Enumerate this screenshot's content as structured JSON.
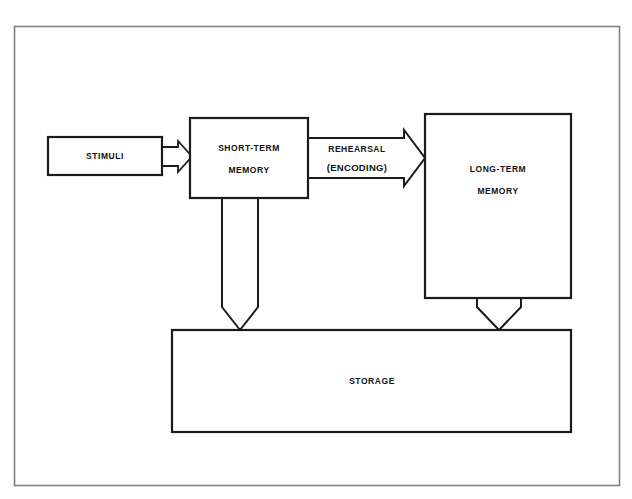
{
  "diagram": {
    "background_color": "#ffffff",
    "frame": {
      "name": "outer-border",
      "stroke_color": "#808080"
    },
    "nodes": [
      {
        "id": "stimuli",
        "label": "STIMULI",
        "shape": "rectangle"
      },
      {
        "id": "short-term-memory",
        "label_line1": "SHORT-TERM",
        "label_line2": "MEMORY",
        "shape": "rectangle"
      },
      {
        "id": "long-term-memory",
        "label_line1": "LONG-TERM",
        "label_line2": "MEMORY",
        "shape": "rectangle"
      },
      {
        "id": "storage",
        "label": "STORAGE",
        "shape": "rectangle"
      }
    ],
    "connectors": [
      {
        "id": "stimuli-to-stm",
        "label": "",
        "direction": "right",
        "shape": "block-arrow"
      },
      {
        "id": "rehearsal-encoding",
        "label_line1": "REHEARSAL",
        "label_line2": "(ENCODING)",
        "direction": "right",
        "shape": "block-arrow"
      },
      {
        "id": "stm-to-storage",
        "label": "",
        "direction": "down",
        "shape": "block-arrow"
      },
      {
        "id": "ltm-to-storage",
        "label": "",
        "direction": "down",
        "shape": "block-arrow"
      }
    ],
    "colors": {
      "stroke": "#1b1b1b",
      "fill": "#ffffff",
      "frame_stroke": "#808080"
    }
  }
}
